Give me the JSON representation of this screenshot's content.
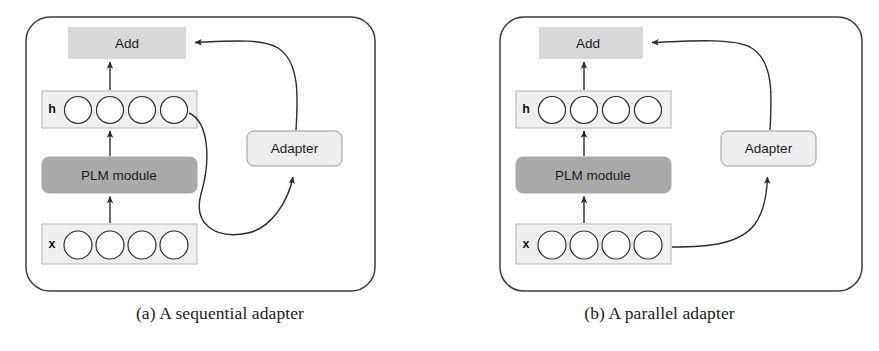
{
  "figure": {
    "background": "#ffffff",
    "panels": [
      {
        "id": "a",
        "caption": "(a) A sequential adapter",
        "container": {
          "stroke": "#3c3c3c"
        },
        "nodes": {
          "add": {
            "label": "Add",
            "fill": "#d8d8d8"
          },
          "h_row": {
            "label": "h",
            "fill": "#efefef",
            "stroke": "#b4b4b4",
            "units": 4
          },
          "plm": {
            "label": "PLM module",
            "fill": "#a9a9a9",
            "stroke": "#a9a9a9"
          },
          "x_row": {
            "label": "x",
            "fill": "#efefef",
            "stroke": "#b4b4b4",
            "units": 4
          },
          "adapter": {
            "label": "Adapter",
            "fill": "#ededed",
            "stroke": "#9a9a9a"
          }
        },
        "edges": [
          {
            "name": "x-to-plm",
            "kind": "straight-up"
          },
          {
            "name": "plm-to-h",
            "kind": "straight-up"
          },
          {
            "name": "h-to-add",
            "kind": "straight-up"
          },
          {
            "name": "h-to-adapter",
            "kind": "curve"
          },
          {
            "name": "adapter-to-add",
            "kind": "curve"
          }
        ]
      },
      {
        "id": "b",
        "caption": "(b) A parallel adapter",
        "container": {
          "stroke": "#3c3c3c"
        },
        "nodes": {
          "add": {
            "label": "Add",
            "fill": "#d8d8d8"
          },
          "h_row": {
            "label": "h",
            "fill": "#efefef",
            "stroke": "#b4b4b4",
            "units": 4
          },
          "plm": {
            "label": "PLM module",
            "fill": "#a9a9a9",
            "stroke": "#a9a9a9"
          },
          "x_row": {
            "label": "x",
            "fill": "#efefef",
            "stroke": "#b4b4b4",
            "units": 4
          },
          "adapter": {
            "label": "Adapter",
            "fill": "#ededed",
            "stroke": "#9a9a9a"
          }
        },
        "edges": [
          {
            "name": "x-to-plm",
            "kind": "straight-up"
          },
          {
            "name": "plm-to-h",
            "kind": "straight-up"
          },
          {
            "name": "h-to-add",
            "kind": "straight-up"
          },
          {
            "name": "x-to-adapter",
            "kind": "curve"
          },
          {
            "name": "adapter-to-add",
            "kind": "curve"
          }
        ]
      }
    ]
  }
}
